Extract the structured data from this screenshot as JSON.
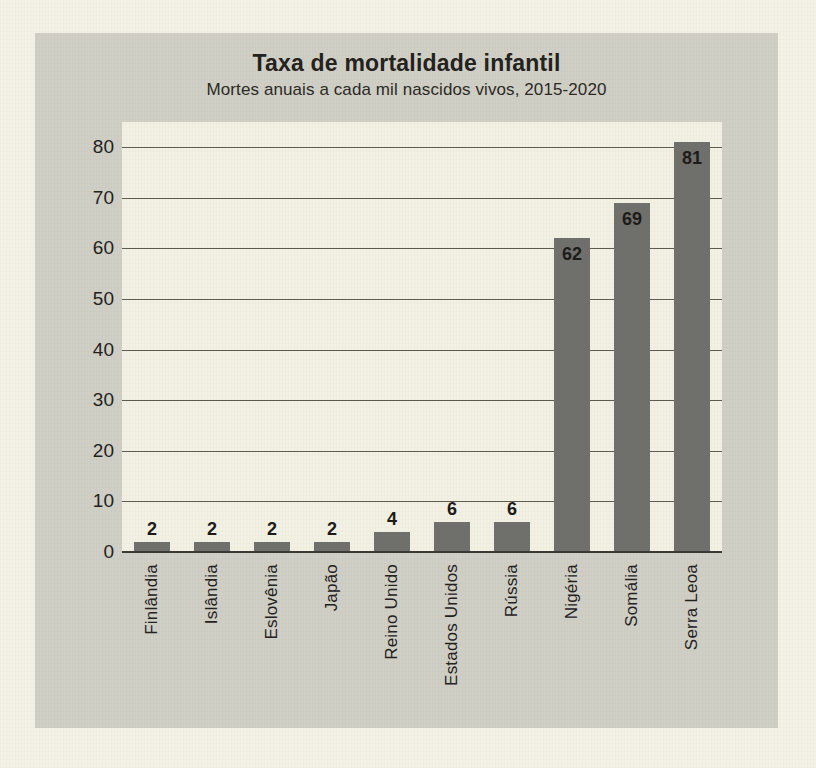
{
  "chart_data": {
    "type": "bar",
    "title": "Taxa de mortalidade infantil",
    "subtitle": "Mortes anuais a cada mil nascidos vivos, 2015-2020",
    "xlabel": "",
    "ylabel": "",
    "ylim": [
      0,
      85
    ],
    "yticks": [
      0,
      10,
      20,
      30,
      40,
      50,
      60,
      70,
      80
    ],
    "grid": true,
    "legend": false,
    "orientation": "vertical",
    "bar_color": "#6f6f6c",
    "plot_background": "#f3f1e4",
    "panel_background": "#cfcfc6",
    "page_background": "#f4f2e7",
    "categories": [
      "Finlândia",
      "Islândia",
      "Eslovênia",
      "Japão",
      "Reino Unido",
      "Estados Unidos",
      "Rússia",
      "Nigéria",
      "Somália",
      "Serra Leoa"
    ],
    "values": [
      2,
      2,
      2,
      2,
      4,
      6,
      6,
      62,
      69,
      81
    ],
    "value_labels": [
      "2",
      "2",
      "2",
      "2",
      "4",
      "6",
      "6",
      "62",
      "69",
      "81"
    ],
    "tick_labels": [
      "0",
      "10",
      "20",
      "30",
      "40",
      "50",
      "60",
      "70",
      "80"
    ]
  }
}
